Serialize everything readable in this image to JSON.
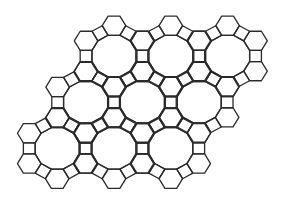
{
  "diagram": {
    "type": "truncated-trihexagonal-tiling",
    "vertex_configuration": "4.6.12",
    "edge_length": 11.8,
    "vertical_scale": 0.94,
    "stroke_color": "#2b2b2b",
    "background_color": "#ffffff",
    "dodecagon_centers": [
      [
        114.0,
        56.0
      ],
      [
        170.8,
        56.0
      ],
      [
        227.6,
        56.0
      ],
      [
        85.6,
        102.2
      ],
      [
        142.4,
        102.2
      ],
      [
        199.2,
        102.2
      ],
      [
        57.2,
        148.4
      ],
      [
        114.0,
        148.4
      ],
      [
        170.8,
        148.4
      ]
    ],
    "counts": {
      "dodecagons": 9
    }
  }
}
